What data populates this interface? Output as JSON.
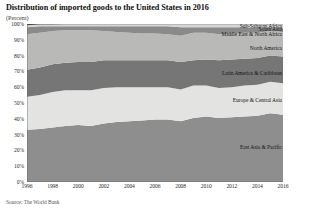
{
  "header": {
    "title": "Distribution of imported goods to the United States in 2016",
    "subtitle": "(Percent)"
  },
  "footer": {
    "source": "Source: The World Bank"
  },
  "chart_data": {
    "type": "area",
    "stacked": true,
    "normalized": true,
    "title": "Distribution of imported goods to the United States in 2016",
    "subtitle": "(Percent)",
    "xlabel": "",
    "ylabel": "",
    "ylim": [
      0,
      100
    ],
    "xlim": [
      1996,
      2016
    ],
    "grid": false,
    "legend_position": "inline-right",
    "ytick_labels": [
      "0%",
      "10%",
      "20%",
      "30%",
      "40%",
      "50%",
      "60%",
      "70%",
      "80%",
      "90%",
      "100%"
    ],
    "ytick_values": [
      0,
      10,
      20,
      30,
      40,
      50,
      60,
      70,
      80,
      90,
      100
    ],
    "xtick_labels": [
      "1996",
      "1998",
      "2000",
      "2002",
      "2004",
      "2006",
      "2008",
      "2010",
      "2012",
      "2014",
      "2016"
    ],
    "xtick_values": [
      1996,
      1998,
      2000,
      2002,
      2004,
      2006,
      2008,
      2010,
      2012,
      2014,
      2016
    ],
    "x": [
      1996,
      1997,
      1998,
      1999,
      2000,
      2001,
      2002,
      2003,
      2004,
      2005,
      2006,
      2007,
      2008,
      2009,
      2010,
      2011,
      2012,
      2013,
      2014,
      2015,
      2016
    ],
    "series": [
      {
        "name": "East Asia & Pacific",
        "color": "#8e8e8e",
        "values": [
          33.0,
          33.5,
          34.5,
          35.5,
          36.0,
          35.5,
          37.0,
          38.0,
          38.5,
          39.0,
          39.5,
          39.5,
          38.5,
          40.5,
          41.5,
          40.5,
          41.0,
          41.5,
          42.0,
          43.5,
          42.5
        ]
      },
      {
        "name": "Europe & Central Asia",
        "color": "#e3e3e1",
        "values": [
          21.0,
          21.5,
          22.5,
          22.5,
          22.0,
          22.5,
          22.5,
          22.0,
          21.5,
          21.0,
          20.5,
          20.5,
          20.0,
          20.5,
          19.5,
          19.0,
          19.0,
          19.5,
          19.5,
          20.0,
          20.0
        ]
      },
      {
        "name": "Latin America & Caribbean",
        "color": "#767676",
        "values": [
          17.0,
          17.5,
          17.5,
          17.5,
          18.0,
          18.0,
          17.5,
          17.0,
          17.0,
          17.0,
          17.0,
          17.0,
          17.5,
          16.0,
          16.5,
          17.5,
          17.5,
          17.0,
          17.0,
          16.5,
          17.0
        ]
      },
      {
        "name": "North America",
        "color": "#b9b9b7",
        "values": [
          22.5,
          22.0,
          21.0,
          20.5,
          20.0,
          20.0,
          18.5,
          18.0,
          17.5,
          17.0,
          17.0,
          16.5,
          16.5,
          17.5,
          17.0,
          16.5,
          16.5,
          16.5,
          16.0,
          15.5,
          15.5
        ]
      },
      {
        "name": "Middle East & North Africa",
        "color": "#8a8a8a",
        "values": [
          4.5,
          4.0,
          3.0,
          2.5,
          2.5,
          2.5,
          3.0,
          3.5,
          4.0,
          4.5,
          4.5,
          5.0,
          5.5,
          3.5,
          3.5,
          4.5,
          4.0,
          3.5,
          3.0,
          2.0,
          2.5
        ]
      },
      {
        "name": "South Asia",
        "color": "#d4d4d2",
        "values": [
          1.2,
          1.2,
          1.2,
          1.3,
          1.3,
          1.3,
          1.3,
          1.3,
          1.4,
          1.4,
          1.4,
          1.4,
          1.8,
          1.8,
          1.8,
          1.9,
          1.9,
          1.9,
          2.3,
          2.3,
          2.3
        ]
      },
      {
        "name": "Sub-Saharan Africa",
        "color": "#4a4a4a",
        "values": [
          0.8,
          0.8,
          0.8,
          0.8,
          0.9,
          0.9,
          0.9,
          0.9,
          0.9,
          1.0,
          1.0,
          1.0,
          1.2,
          0.9,
          0.9,
          1.0,
          0.9,
          0.9,
          0.9,
          0.9,
          0.9
        ]
      }
    ],
    "inline_labels": [
      {
        "name": "Sub-Saharan Africa",
        "x_pct": 100,
        "y_pct": 98.6
      },
      {
        "name": "South Asia",
        "x_pct": 100,
        "y_pct": 96.6
      },
      {
        "name": "Middle East & North Africa",
        "x_pct": 100,
        "y_pct": 94.0
      },
      {
        "name": "North America",
        "x_pct": 100,
        "y_pct": 85.0
      },
      {
        "name": "Latin America & Caribbean",
        "x_pct": 100,
        "y_pct": 69.0
      },
      {
        "name": "Europe & Central Asia",
        "x_pct": 100,
        "y_pct": 52.0
      },
      {
        "name": "East Asia & Pacific",
        "x_pct": 100,
        "y_pct": 22.0
      }
    ]
  }
}
